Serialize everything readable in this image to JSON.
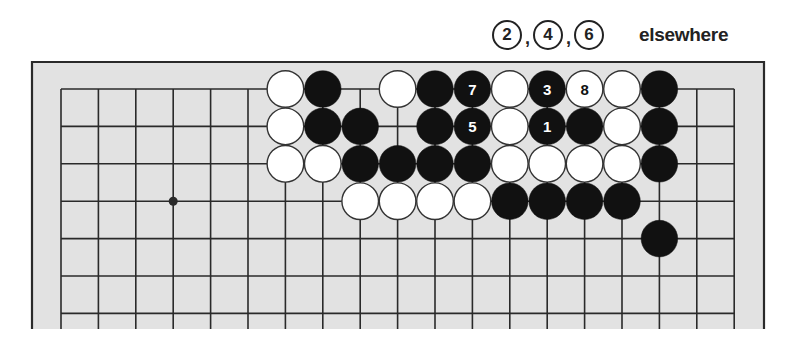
{
  "caption": {
    "moves_elsewhere": [
      "2",
      "4",
      "6"
    ],
    "separator": ",",
    "label": "elsewhere"
  },
  "board": {
    "colors": {
      "background": "#e2e2e2",
      "line": "#2a2a2a",
      "black": "#111111",
      "white": "#ffffff"
    },
    "grid": {
      "columns": 19,
      "visible_rows": 7,
      "x0": 61,
      "y0": 89,
      "spacing": 37.4
    },
    "frame": {
      "left": 32,
      "top": 62,
      "right": 764,
      "bottom": 329
    },
    "star_points": [
      {
        "col": 3,
        "row": 3
      }
    ],
    "stones": [
      {
        "col": 6,
        "row": 0,
        "color": "white"
      },
      {
        "col": 7,
        "row": 0,
        "color": "black"
      },
      {
        "col": 9,
        "row": 0,
        "color": "white"
      },
      {
        "col": 10,
        "row": 0,
        "color": "black"
      },
      {
        "col": 11,
        "row": 0,
        "color": "black",
        "label": "7"
      },
      {
        "col": 12,
        "row": 0,
        "color": "white"
      },
      {
        "col": 13,
        "row": 0,
        "color": "black",
        "label": "3"
      },
      {
        "col": 14,
        "row": 0,
        "color": "white",
        "label": "8"
      },
      {
        "col": 15,
        "row": 0,
        "color": "white"
      },
      {
        "col": 16,
        "row": 0,
        "color": "black"
      },
      {
        "col": 6,
        "row": 1,
        "color": "white"
      },
      {
        "col": 7,
        "row": 1,
        "color": "black"
      },
      {
        "col": 8,
        "row": 1,
        "color": "black"
      },
      {
        "col": 10,
        "row": 1,
        "color": "black"
      },
      {
        "col": 11,
        "row": 1,
        "color": "black",
        "label": "5"
      },
      {
        "col": 12,
        "row": 1,
        "color": "white"
      },
      {
        "col": 13,
        "row": 1,
        "color": "black",
        "label": "1"
      },
      {
        "col": 14,
        "row": 1,
        "color": "black"
      },
      {
        "col": 15,
        "row": 1,
        "color": "white"
      },
      {
        "col": 16,
        "row": 1,
        "color": "black"
      },
      {
        "col": 6,
        "row": 2,
        "color": "white"
      },
      {
        "col": 7,
        "row": 2,
        "color": "white"
      },
      {
        "col": 8,
        "row": 2,
        "color": "black"
      },
      {
        "col": 9,
        "row": 2,
        "color": "black"
      },
      {
        "col": 10,
        "row": 2,
        "color": "black"
      },
      {
        "col": 11,
        "row": 2,
        "color": "black"
      },
      {
        "col": 12,
        "row": 2,
        "color": "white"
      },
      {
        "col": 13,
        "row": 2,
        "color": "white"
      },
      {
        "col": 14,
        "row": 2,
        "color": "white"
      },
      {
        "col": 15,
        "row": 2,
        "color": "white"
      },
      {
        "col": 16,
        "row": 2,
        "color": "black"
      },
      {
        "col": 8,
        "row": 3,
        "color": "white"
      },
      {
        "col": 9,
        "row": 3,
        "color": "white"
      },
      {
        "col": 10,
        "row": 3,
        "color": "white"
      },
      {
        "col": 11,
        "row": 3,
        "color": "white"
      },
      {
        "col": 12,
        "row": 3,
        "color": "black"
      },
      {
        "col": 13,
        "row": 3,
        "color": "black"
      },
      {
        "col": 14,
        "row": 3,
        "color": "black"
      },
      {
        "col": 15,
        "row": 3,
        "color": "black"
      },
      {
        "col": 16,
        "row": 4,
        "color": "black"
      }
    ]
  }
}
